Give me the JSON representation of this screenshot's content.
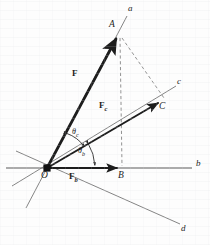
{
  "figure": {
    "background_color": "#fdfdfd",
    "ink_color": "#1d1d1d",
    "axis_color": "#555555",
    "dashed_color": "#777777"
  },
  "axes": [
    {
      "id": "a",
      "label": "a",
      "label_x": 128,
      "label_y": 7,
      "direction_deg": 62
    },
    {
      "id": "b",
      "label": "b",
      "label_x": 196,
      "label_y": 163,
      "direction_deg": 0
    },
    {
      "id": "c",
      "label": "c",
      "label_x": 177,
      "label_y": 80,
      "direction_deg": 27
    },
    {
      "id": "d",
      "label": "d",
      "label_x": 181,
      "label_y": 228,
      "direction_deg": -28
    }
  ],
  "points": [
    {
      "id": "O",
      "label": "O",
      "x": 47,
      "y": 168,
      "label_x": 41,
      "label_y": 172,
      "marker": "dot"
    },
    {
      "id": "A",
      "label": "A",
      "x": 119,
      "y": 33,
      "label_x": 110,
      "label_y": 23,
      "marker": "arrowhead"
    },
    {
      "id": "B",
      "label": "B",
      "x": 122,
      "y": 168,
      "label_x": 118,
      "label_y": 172,
      "marker": "none"
    },
    {
      "id": "C",
      "label": "C",
      "x": 163,
      "y": 100,
      "label_x": 159,
      "label_y": 104,
      "marker": "arrowhead"
    }
  ],
  "vectors": [
    {
      "id": "F",
      "label": "F",
      "sub": "",
      "from": "O",
      "to": "A",
      "label_x": 73,
      "label_y": 73,
      "weight": "heavy"
    },
    {
      "id": "Fb",
      "label": "F",
      "sub": "b",
      "from": "O",
      "to": "B",
      "label_x": 72,
      "label_y": 175,
      "weight": "medium"
    },
    {
      "id": "Fc",
      "label": "F",
      "sub": "c",
      "from": "O",
      "to": "C",
      "label_x": 100,
      "label_y": 104,
      "weight": "medium"
    }
  ],
  "angles": [
    {
      "id": "theta_c",
      "label": "θ",
      "sub": "c",
      "between": "F and Fc",
      "label_x": 73,
      "label_y": 131,
      "radius": 36
    },
    {
      "id": "theta_b",
      "label": "θ",
      "sub": "b",
      "between": "Fc and Fb",
      "label_x": 78,
      "label_y": 150,
      "radius": 47
    }
  ],
  "construction_lines": [
    {
      "id": "A-to-B",
      "style": "dashed",
      "from": "A",
      "to": "B"
    },
    {
      "id": "A-to-C",
      "style": "dashed",
      "from": "A",
      "to": "C"
    }
  ]
}
